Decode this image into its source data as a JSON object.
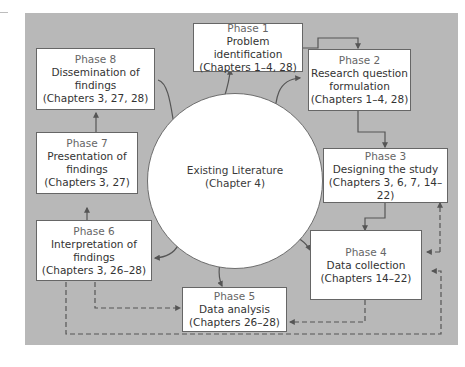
{
  "diagram": {
    "center": {
      "title": "Existing Literature",
      "subtitle": "(Chapter 4)"
    },
    "phases": [
      {
        "id": 1,
        "label": "Phase 1",
        "lines": [
          "Problem identification"
        ],
        "chapters": "(Chapters 1–4, 28)"
      },
      {
        "id": 2,
        "label": "Phase 2",
        "lines": [
          "Research question",
          "formulation"
        ],
        "chapters": "(Chapters 1–4, 28)"
      },
      {
        "id": 3,
        "label": "Phase 3",
        "lines": [
          "Designing the study"
        ],
        "chapters": "(Chapters 3, 6, 7, 14–22)"
      },
      {
        "id": 4,
        "label": "Phase 4",
        "lines": [
          "Data collection"
        ],
        "chapters": "(Chapters 14–22)"
      },
      {
        "id": 5,
        "label": "Phase 5",
        "lines": [
          "Data analysis"
        ],
        "chapters": "(Chapters 26–28)"
      },
      {
        "id": 6,
        "label": "Phase 6",
        "lines": [
          "Interpretation of",
          "findings"
        ],
        "chapters": "(Chapters 3, 26–28)"
      },
      {
        "id": 7,
        "label": "Phase 7",
        "lines": [
          "Presentation of",
          "findings"
        ],
        "chapters": "(Chapters 3, 27)"
      },
      {
        "id": 8,
        "label": "Phase 8",
        "lines": [
          "Dissemination of",
          "findings"
        ],
        "chapters": "(Chapters 3, 27, 28)"
      }
    ],
    "solid_flow": [
      "Phase 1 → Phase 2",
      "Phase 2 → Phase 3",
      "Phase 3 → Phase 4",
      "Phase 6 → Phase 7",
      "Phase 7 → Phase 8"
    ],
    "dashed_feedback": [
      "Phase 4 → Phase 5",
      "Phase 5 → Phase 4",
      "Phase 6 ↔ Phase 5",
      "Phase 4 → Phase 3",
      "Phase 6 ↔ Phase 4 (bottom loop)"
    ],
    "colors": {
      "panel": "#b8b8b8",
      "box": "#ffffff",
      "line": "#5a5a5a"
    }
  }
}
